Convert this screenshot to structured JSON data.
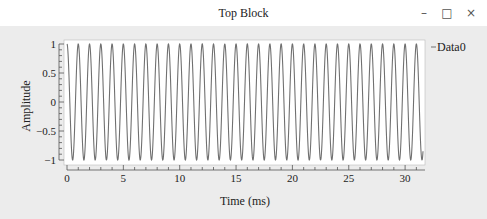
{
  "window": {
    "title": "Top Block",
    "controls": {
      "minimize": "–",
      "maximize": "□",
      "close": "×"
    }
  },
  "chart_data": {
    "type": "line",
    "title": "",
    "xlabel": "Time (ms)",
    "ylabel": "Amplitude",
    "xlim": [
      0,
      31.8
    ],
    "ylim": [
      -1,
      1
    ],
    "x_ticks": [
      0,
      5,
      10,
      15,
      20,
      25,
      30
    ],
    "x_tick_labels": [
      "0",
      "5",
      "10",
      "15",
      "20",
      "25",
      "30"
    ],
    "y_ticks": [
      1,
      0.5,
      0,
      -0.5,
      -1
    ],
    "y_tick_labels": [
      "1",
      "0.5",
      "0",
      "−0.5",
      "−1"
    ],
    "grid": false,
    "legend": {
      "position": "right-top",
      "entries": [
        "Data0"
      ]
    },
    "series": [
      {
        "name": "Data0",
        "function": "cos(2*pi*1*t)",
        "frequency_khz": 1,
        "amplitude": 1,
        "cycles_visible": 32,
        "color": "#707070"
      }
    ]
  },
  "colors": {
    "background": "#ececec",
    "plot_bg": "#ffffff",
    "line": "#707070",
    "axis": "#555555"
  }
}
